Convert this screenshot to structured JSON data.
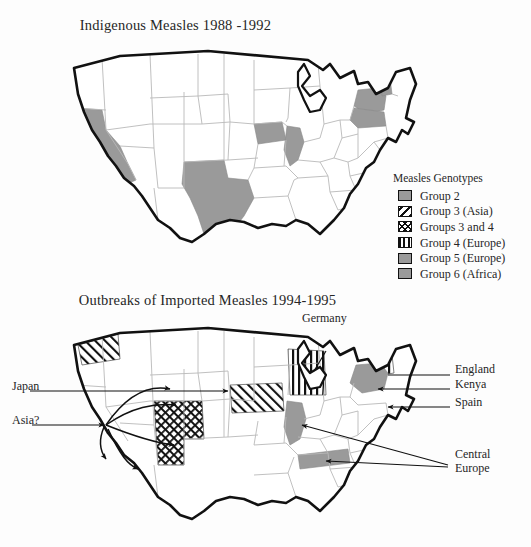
{
  "figure": {
    "background_color": "#fdfdfd",
    "ink_color": "#1b1b1b",
    "gray_fill": "#9a9a9a",
    "state_line_color": "#b9b9b9",
    "outline_color": "#111111"
  },
  "top_map": {
    "title": "Indigenous Measles 1988 -1992",
    "shaded_states": [
      "California",
      "Texas",
      "Iowa",
      "Illinois",
      "New York",
      "Pennsylvania",
      "Vermont"
    ],
    "shade_pattern": "solid-gray",
    "shade_color": "#9a9a9a"
  },
  "bottom_map": {
    "title": "Outbreaks of Imported Measles 1994-1995",
    "regions": [
      {
        "state": "Washington",
        "pattern": "diagonal-hatch",
        "genotype": "Group 3 (Asia)"
      },
      {
        "state": "Utah",
        "pattern": "cross-hatch",
        "genotype": "Groups 3 and 4"
      },
      {
        "state": "Arizona",
        "pattern": "cross-hatch",
        "genotype": "Groups 3 and 4"
      },
      {
        "state": "Nebraska-Kansas",
        "pattern": "diagonal-hatch",
        "genotype": "Group 3 (Asia)"
      },
      {
        "state": "Wisconsin-Michigan",
        "pattern": "vertical-stripe",
        "genotype": "Group 4 (Europe)"
      },
      {
        "state": "New York",
        "pattern": "solid-gray",
        "genotype": "Group 5 (Europe)"
      },
      {
        "state": "Vermont",
        "pattern": "vertical-stripe",
        "genotype": "Group 4 (Europe)"
      },
      {
        "state": "Illinois",
        "pattern": "solid-gray",
        "genotype": "Group 5 (Europe)"
      },
      {
        "state": "Tennessee",
        "pattern": "solid-gray",
        "genotype": "Group 5 (Europe)"
      }
    ],
    "annotations": [
      {
        "id": "japan",
        "label": "Japan",
        "side": "left"
      },
      {
        "id": "asia",
        "label": "Asia?",
        "side": "left"
      },
      {
        "id": "germany",
        "label": "Germany",
        "side": "top"
      },
      {
        "id": "england",
        "label": "England",
        "side": "right"
      },
      {
        "id": "kenya",
        "label": "Kenya",
        "side": "right"
      },
      {
        "id": "spain",
        "label": "Spain",
        "side": "right"
      },
      {
        "id": "central-europe",
        "label": "Central\nEurope",
        "line1": "Central",
        "line2": "Europe",
        "side": "right"
      }
    ]
  },
  "legend": {
    "title": "Measles Genotypes",
    "items": [
      {
        "label": "Group 2",
        "pattern": "solid-gray"
      },
      {
        "label": "Group 3 (Asia)",
        "pattern": "diagonal-hatch"
      },
      {
        "label": "Groups 3 and 4",
        "pattern": "cross-hatch"
      },
      {
        "label": "Group 4 (Europe)",
        "pattern": "vertical-stripe"
      },
      {
        "label": "Group 5 (Europe)",
        "pattern": "solid-gray"
      },
      {
        "label": "Group 6 (Africa)",
        "pattern": "solid-gray"
      }
    ]
  }
}
